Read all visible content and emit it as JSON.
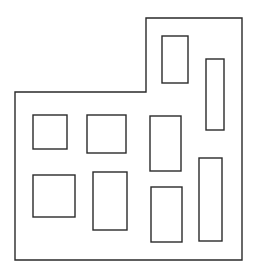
{
  "diagram": {
    "width": 254,
    "height": 272,
    "stroke_color": "#2a2a2a",
    "background": "#ffffff",
    "outline": {
      "points": [
        [
          15,
          92
        ],
        [
          146,
          92
        ],
        [
          146,
          18
        ],
        [
          242,
          18
        ],
        [
          242,
          260
        ],
        [
          15,
          260
        ]
      ]
    },
    "rects": [
      {
        "id": "top-upper",
        "x": 162,
        "y": 36,
        "w": 26,
        "h": 47
      },
      {
        "id": "right-tall-upper",
        "x": 206,
        "y": 59,
        "w": 18,
        "h": 71
      },
      {
        "id": "left-upper-square",
        "x": 33,
        "y": 115,
        "w": 34,
        "h": 34
      },
      {
        "id": "mid-upper",
        "x": 87,
        "y": 115,
        "w": 39,
        "h": 38
      },
      {
        "id": "center-upper",
        "x": 150,
        "y": 116,
        "w": 31,
        "h": 55
      },
      {
        "id": "left-lower-square",
        "x": 33,
        "y": 175,
        "w": 42,
        "h": 42
      },
      {
        "id": "mid-lower",
        "x": 93,
        "y": 172,
        "w": 34,
        "h": 58
      },
      {
        "id": "center-lower",
        "x": 151,
        "y": 187,
        "w": 31,
        "h": 55
      },
      {
        "id": "right-tall-lower",
        "x": 199,
        "y": 158,
        "w": 23,
        "h": 83
      }
    ]
  }
}
